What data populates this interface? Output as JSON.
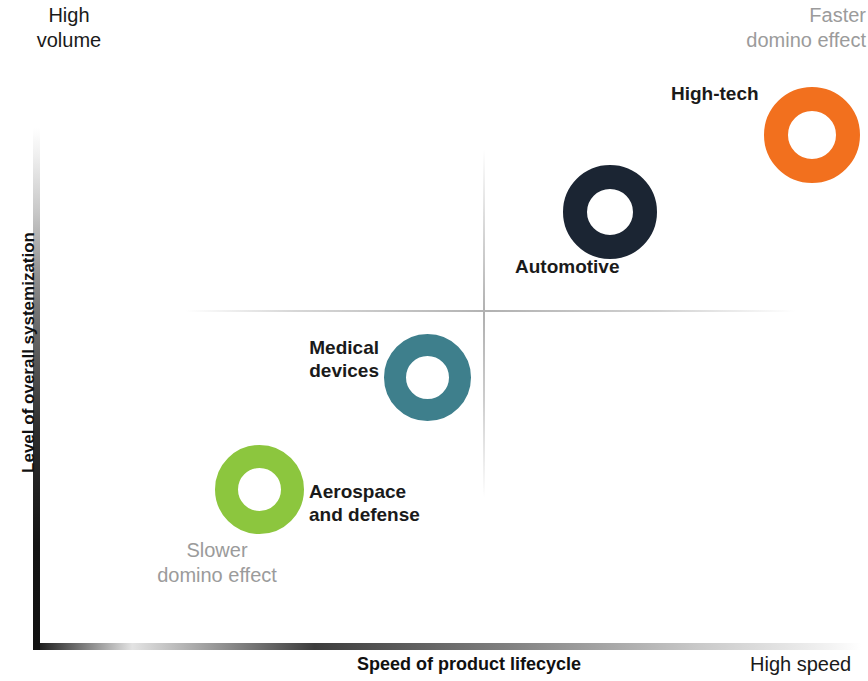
{
  "chart_data": {
    "type": "scatter",
    "title": "",
    "subtitle": "",
    "xlabel": "Speed of product lifecycle",
    "ylabel": "Level of overall systemization",
    "xlim": [
      0,
      100
    ],
    "ylim": [
      0,
      100
    ],
    "grid": false,
    "legend_position": "none",
    "quadrant_lines": {
      "x": 55,
      "y": 55,
      "color": "#b6b6b6"
    },
    "axis_captions": {
      "y_top": "High\nvolume",
      "x_right": "High speed",
      "top_right_note": "Faster\ndomino effect",
      "bottom_left_note": "Slower\ndomino effect"
    },
    "marker_style": "donut",
    "series": [
      {
        "name": "High-tech",
        "label": "High-tech",
        "x": 93,
        "y": 90,
        "size": 96,
        "color": "#F2701E",
        "label_position": "left"
      },
      {
        "name": "Automotive",
        "label": "Automotive",
        "x": 71,
        "y": 74,
        "size": 94,
        "color": "#1B2533",
        "label_position": "bottom-left"
      },
      {
        "name": "Medical devices",
        "label": "Medical\ndevices",
        "x": 50,
        "y": 45,
        "size": 87,
        "color": "#3E7F8C",
        "label_position": "left"
      },
      {
        "name": "Aerospace and defense",
        "label": "Aerospace\nand defense",
        "x": 29,
        "y": 23,
        "size": 89,
        "color": "#8CC63E",
        "label_position": "right"
      }
    ]
  },
  "axes": {
    "y_title": "Level of overall systemization",
    "x_title": "Speed of product lifecycle"
  },
  "notes": {
    "high_volume": "High\nvolume",
    "faster_domino": "Faster\ndomino effect",
    "slower_domino": "Slower\ndomino effect",
    "high_speed": "High speed"
  },
  "labels": {
    "high_tech": "High-tech",
    "automotive": "Automotive",
    "medical_devices": "Medical\ndevices",
    "aerospace_defense": "Aerospace\nand defense"
  },
  "colors": {
    "high_tech": "#F2701E",
    "automotive": "#1B2533",
    "medical_devices": "#3E7F8C",
    "aerospace_defense": "#8CC63E",
    "note_gray": "#9b9b9b",
    "text_dark": "#1a1a1a",
    "quadrant_line": "#b6b6b6",
    "background": "#ffffff"
  }
}
